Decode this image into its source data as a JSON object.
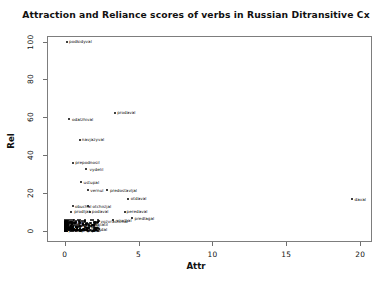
{
  "chart_data": {
    "type": "scatter",
    "title": "Attraction and Reliance scores of verbs in Russian Ditransitive Cx",
    "xlabel": "Attr",
    "ylabel": "Rel",
    "xlim": [
      -1.2,
      20.8
    ],
    "ylim": [
      -6,
      103
    ],
    "xticks": [
      0,
      5,
      10,
      15,
      20
    ],
    "yticks": [
      0,
      20,
      40,
      60,
      80,
      100
    ],
    "grid": false,
    "legend": null,
    "points": [
      {
        "label": "podkidyval",
        "x": 0.15,
        "y": 100.0
      },
      {
        "label": "odalzhival",
        "x": 0.3,
        "y": 59.0
      },
      {
        "label": "prodaval",
        "x": 3.4,
        "y": 62.5
      },
      {
        "label": "navjazyval",
        "x": 1.0,
        "y": 48.0
      },
      {
        "label": "prepodnosil",
        "x": 0.55,
        "y": 36.0
      },
      {
        "label": "vydelil",
        "x": 1.45,
        "y": 32.5
      },
      {
        "label": "ustupal",
        "x": 1.1,
        "y": 25.5
      },
      {
        "label": "vernul",
        "x": 1.55,
        "y": 21.5
      },
      {
        "label": "predostavljal",
        "x": 2.85,
        "y": 21.5
      },
      {
        "label": "otdaval",
        "x": 4.3,
        "y": 17.0
      },
      {
        "label": "obuchal",
        "x": 0.55,
        "y": 13.0
      },
      {
        "label": "otchisljal",
        "x": 1.6,
        "y": 13.0
      },
      {
        "label": "prodljal",
        "x": 0.4,
        "y": 10.0
      },
      {
        "label": "podaval",
        "x": 1.7,
        "y": 10.0
      },
      {
        "label": "peredaval",
        "x": 4.05,
        "y": 10.0
      },
      {
        "label": "predlagal",
        "x": 4.55,
        "y": 6.5
      },
      {
        "label": "vruchal",
        "x": 3.3,
        "y": 5.5
      },
      {
        "label": "vozvrashchal",
        "x": 2.3,
        "y": 5.0
      },
      {
        "label": "daval",
        "x": 19.45,
        "y": 16.5
      },
      {
        "label": "poslal",
        "x": 0.2,
        "y": 4.5
      },
      {
        "label": "pisal",
        "x": 0.7,
        "y": 4.0
      },
      {
        "label": "brosal",
        "x": 1.25,
        "y": 3.5
      },
      {
        "label": "platil",
        "x": 1.95,
        "y": 3.0
      },
      {
        "label": "pokazyval",
        "x": 0.45,
        "y": 2.5
      },
      {
        "label": "govoril",
        "x": 1.05,
        "y": 2.0
      },
      {
        "label": "nesl",
        "x": 1.6,
        "y": 1.5
      },
      {
        "label": "darit",
        "x": 0.25,
        "y": 1.0
      },
      {
        "label": "vydaval",
        "x": 0.85,
        "y": 0.8
      },
      {
        "label": "sdal",
        "x": 2.1,
        "y": 0.5
      },
      {
        "label": "otpravljal",
        "x": 0.6,
        "y": 0.3
      },
      {
        "label": "prines",
        "x": 1.35,
        "y": 0.2
      },
      {
        "label": "podvel",
        "x": 0.1,
        "y": 0.1
      }
    ],
    "cluster_note": "dense overplotted mass of verbs near Attr 0-2, Rel 0-6"
  }
}
